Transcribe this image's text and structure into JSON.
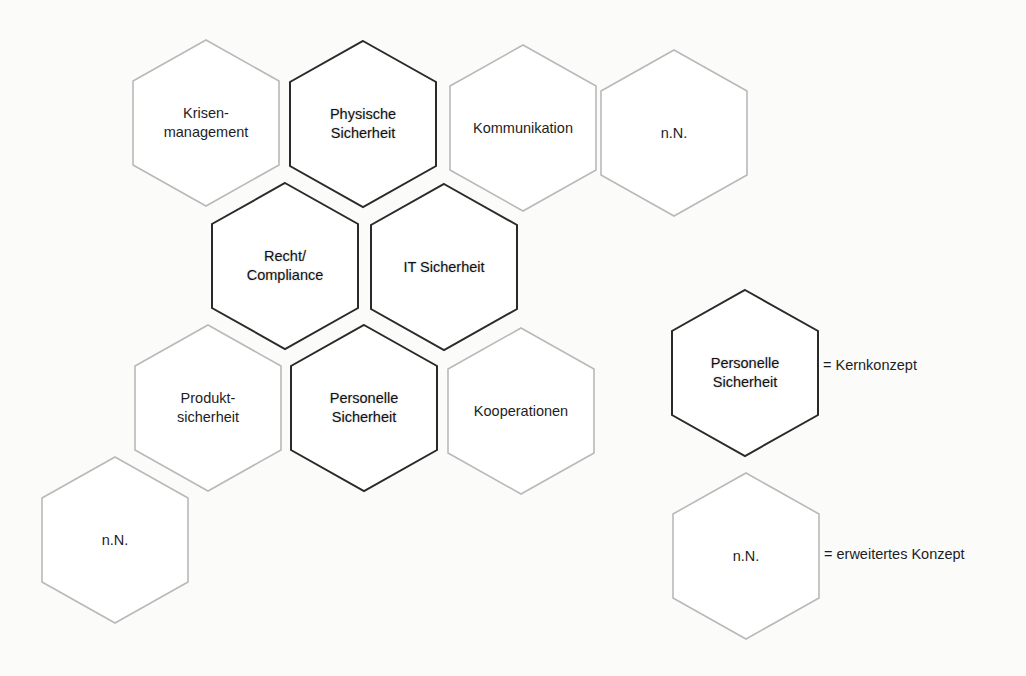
{
  "colors": {
    "core_stroke": "#2a2a2a",
    "extended_stroke": "#b9b9b9",
    "fill": "#ffffff",
    "background": "#fbfbfa"
  },
  "hex_size": {
    "half_width": 73,
    "half_height": 83,
    "shoulder": 42
  },
  "hexagons": [
    {
      "id": "krisenmanagement",
      "label": "Krisen-\nmanagement",
      "type": "extended",
      "cx": 206,
      "cy": 123
    },
    {
      "id": "physische-sicherheit",
      "label": "Physische\nSicherheit",
      "type": "core",
      "cx": 363,
      "cy": 124
    },
    {
      "id": "kommunikation",
      "label": "Kommunikation",
      "type": "extended",
      "cx": 523,
      "cy": 128
    },
    {
      "id": "nn-top",
      "label": "n.N.",
      "type": "extended",
      "cx": 674,
      "cy": 133
    },
    {
      "id": "recht-compliance",
      "label": "Recht/\nCompliance",
      "type": "core",
      "cx": 285,
      "cy": 266
    },
    {
      "id": "it-sicherheit",
      "label": "IT Sicherheit",
      "type": "core",
      "cx": 444,
      "cy": 267
    },
    {
      "id": "produktsicherheit",
      "label": "Produkt-\nsicherheit",
      "type": "extended",
      "cx": 208,
      "cy": 408
    },
    {
      "id": "personelle-sicherheit",
      "label": "Personelle\nSicherheit",
      "type": "core",
      "cx": 364,
      "cy": 408
    },
    {
      "id": "kooperationen",
      "label": "Kooperationen",
      "type": "extended",
      "cx": 521,
      "cy": 411
    },
    {
      "id": "nn-bottom-left",
      "label": "n.N.",
      "type": "extended",
      "cx": 115,
      "cy": 540
    }
  ],
  "legend": [
    {
      "id": "legend-core",
      "hex_label": "Personelle\nSicherheit",
      "type": "core",
      "cx": 745,
      "cy": 373,
      "text": "= Kernkonzept"
    },
    {
      "id": "legend-extended",
      "hex_label": "n.N.",
      "type": "extended",
      "cx": 746,
      "cy": 556,
      "text": "= erweitertes Konzept"
    }
  ]
}
